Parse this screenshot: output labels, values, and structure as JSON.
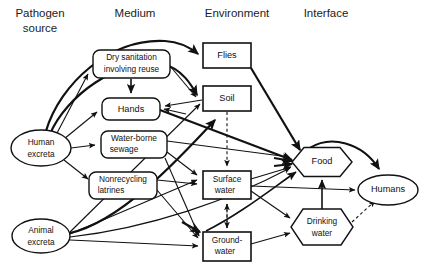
{
  "figure": {
    "type": "flow-diagram",
    "background_color": "#ffffff",
    "line_color": "#111111"
  },
  "columns": [
    {
      "id": "pathogen-source",
      "label": "Pathogen\nsource",
      "line1": "Pathogen",
      "line2": "source",
      "x": 40
    },
    {
      "id": "medium",
      "label": "Medium",
      "line1": "Medium",
      "line2": "",
      "x": 135
    },
    {
      "id": "environment",
      "label": "Environment",
      "line1": "Environment",
      "line2": "",
      "x": 235
    },
    {
      "id": "interface",
      "label": "Interface",
      "line1": "Interface",
      "line2": "",
      "x": 325
    }
  ],
  "nodes": [
    {
      "id": "human-excreta",
      "label": "Human excreta",
      "line1": "Human",
      "line2": "excreta",
      "column": "pathogen-source",
      "shape": "ellipse",
      "cx": 41,
      "cy": 148,
      "rx": 30,
      "ry": 18
    },
    {
      "id": "animal-excreta",
      "label": "Animal excreta",
      "line1": "Animal",
      "line2": "excreta",
      "column": "pathogen-source",
      "shape": "ellipse",
      "cx": 41,
      "cy": 236,
      "rx": 29,
      "ry": 17
    },
    {
      "id": "dry-sanitation",
      "label": "Dry sanitation involving reuse",
      "line1": "Dry sanitation",
      "line2": "involving reuse",
      "column": "medium",
      "shape": "rounded-rect",
      "x": 93,
      "y": 50,
      "w": 77,
      "h": 28
    },
    {
      "id": "hands",
      "label": "Hands",
      "line1": "Hands",
      "line2": "",
      "column": "medium",
      "shape": "rounded-rect",
      "x": 102,
      "y": 98,
      "w": 58,
      "h": 22
    },
    {
      "id": "water-borne-sewage",
      "label": "Water-borne sewage",
      "line1": "Water-borne",
      "line2": "sewage",
      "column": "medium",
      "shape": "rounded-rect",
      "x": 101,
      "y": 131,
      "w": 66,
      "h": 27
    },
    {
      "id": "nonrecycling-latrines",
      "label": "Nonrecycling latrines",
      "line1": "Nonrecycling",
      "line2": "latrines",
      "column": "medium",
      "shape": "rounded-rect",
      "x": 89,
      "y": 172,
      "w": 68,
      "h": 27
    },
    {
      "id": "flies",
      "label": "Flies",
      "line1": "Flies",
      "line2": "",
      "column": "environment",
      "shape": "rect",
      "x": 203,
      "y": 43,
      "w": 48,
      "h": 25
    },
    {
      "id": "soil",
      "label": "Soil",
      "line1": "Soil",
      "line2": "",
      "column": "environment",
      "shape": "rect",
      "x": 203,
      "y": 86,
      "w": 48,
      "h": 25
    },
    {
      "id": "surface-water",
      "label": "Surface water",
      "line1": "Surface",
      "line2": "water",
      "column": "environment",
      "shape": "rect",
      "x": 203,
      "y": 171,
      "w": 48,
      "h": 28
    },
    {
      "id": "groundwater",
      "label": "Groundwater",
      "line1": "Ground-",
      "line2": "water",
      "column": "environment",
      "shape": "rect",
      "x": 203,
      "y": 232,
      "w": 48,
      "h": 29
    },
    {
      "id": "food",
      "label": "Food",
      "line1": "Food",
      "line2": "",
      "column": "interface",
      "shape": "hexagon",
      "cx": 322,
      "cy": 162,
      "w": 60,
      "h": 29
    },
    {
      "id": "drinking-water",
      "label": "Drinking water",
      "line1": "Drinking",
      "line2": "water",
      "column": "interface",
      "shape": "hexagon",
      "cx": 322,
      "cy": 227,
      "w": 62,
      "h": 36
    },
    {
      "id": "humans",
      "label": "Humans",
      "line1": "Humans",
      "line2": "",
      "column": "interface",
      "shape": "ellipse",
      "cx": 388,
      "cy": 190,
      "rx": 30,
      "ry": 15
    }
  ],
  "edges": [
    {
      "from": "human-excreta",
      "to": "flies",
      "style": "thick-curve"
    },
    {
      "from": "human-excreta",
      "to": "soil",
      "style": "thick-curve"
    },
    {
      "from": "human-excreta",
      "to": "dry-sanitation",
      "style": "arrow"
    },
    {
      "from": "human-excreta",
      "to": "hands",
      "style": "arrow"
    },
    {
      "from": "human-excreta",
      "to": "water-borne-sewage",
      "style": "arrow"
    },
    {
      "from": "human-excreta",
      "to": "nonrecycling-latrines",
      "style": "arrow"
    },
    {
      "from": "dry-sanitation",
      "to": "hands",
      "style": "arrow"
    },
    {
      "from": "dry-sanitation",
      "to": "soil",
      "style": "arrow"
    },
    {
      "from": "water-borne-sewage",
      "to": "surface-water",
      "style": "arrow"
    },
    {
      "from": "water-borne-sewage",
      "to": "groundwater",
      "style": "arrow"
    },
    {
      "from": "water-borne-sewage",
      "to": "food",
      "style": "arrow"
    },
    {
      "from": "nonrecycling-latrines",
      "to": "groundwater",
      "style": "arrow"
    },
    {
      "from": "nonrecycling-latrines",
      "to": "surface-water",
      "style": "arrow"
    },
    {
      "from": "soil",
      "to": "hands",
      "style": "arrow"
    },
    {
      "from": "soil",
      "to": "food",
      "style": "arrow"
    },
    {
      "from": "soil",
      "to": "surface-water",
      "style": "dashed"
    },
    {
      "from": "surface-water",
      "to": "groundwater",
      "style": "dashed-bidirectional"
    },
    {
      "from": "flies",
      "to": "food",
      "style": "thick-arrow"
    },
    {
      "from": "hands",
      "to": "food",
      "style": "arrow"
    },
    {
      "from": "surface-water",
      "to": "food",
      "style": "arrow"
    },
    {
      "from": "surface-water",
      "to": "drinking-water",
      "style": "arrow"
    },
    {
      "from": "surface-water",
      "to": "humans",
      "style": "arrow"
    },
    {
      "from": "groundwater",
      "to": "drinking-water",
      "style": "arrow"
    },
    {
      "from": "groundwater",
      "to": "food",
      "style": "arrow"
    },
    {
      "from": "drinking-water",
      "to": "food",
      "style": "arrow"
    },
    {
      "from": "drinking-water",
      "to": "humans",
      "style": "dashed-arrow"
    },
    {
      "from": "food",
      "to": "humans",
      "style": "thick-arrow"
    },
    {
      "from": "animal-excreta",
      "to": "surface-water",
      "style": "arrow"
    },
    {
      "from": "animal-excreta",
      "to": "groundwater",
      "style": "arrow"
    },
    {
      "from": "animal-excreta",
      "to": "soil",
      "style": "arrow"
    },
    {
      "from": "animal-excreta",
      "to": "food",
      "style": "arrow"
    },
    {
      "from": "animal-excreta",
      "to": "hands",
      "style": "arrow"
    }
  ]
}
